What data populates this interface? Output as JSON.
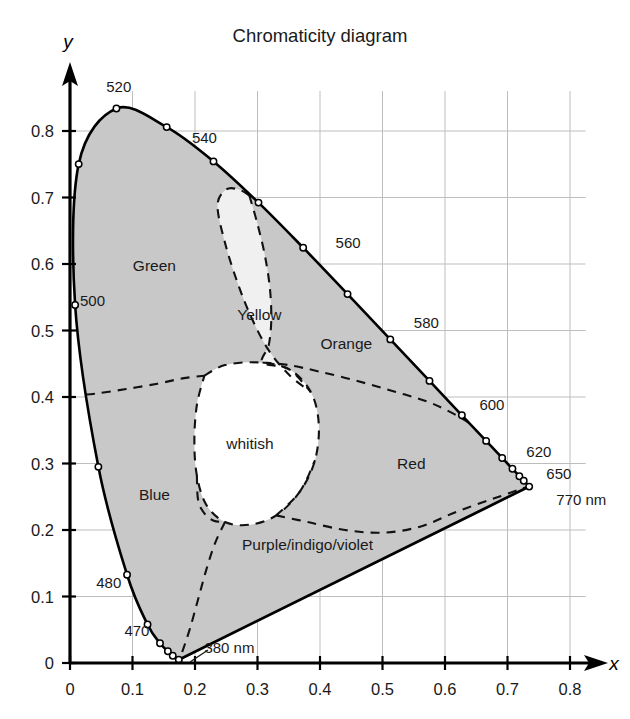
{
  "title": "Chromaticity diagram",
  "axes": {
    "x_name": "x",
    "y_name": "y",
    "x_ticks": [
      "0",
      "0.1",
      "0.2",
      "0.3",
      "0.4",
      "0.5",
      "0.6",
      "0.7",
      "0.8"
    ],
    "y_ticks": [
      "0",
      "0.1",
      "0.2",
      "0.3",
      "0.4",
      "0.5",
      "0.6",
      "0.7",
      "0.8"
    ]
  },
  "regions": [
    {
      "id": "green",
      "label": "Green",
      "x": 0.135,
      "y": 0.597
    },
    {
      "id": "yellow",
      "label": "Yellow",
      "x": 0.303,
      "y": 0.523
    },
    {
      "id": "orange",
      "label": "Orange",
      "x": 0.442,
      "y": 0.48
    },
    {
      "id": "red",
      "label": "Red",
      "x": 0.546,
      "y": 0.3
    },
    {
      "id": "blue",
      "label": "Blue",
      "x": 0.135,
      "y": 0.253
    },
    {
      "id": "purple",
      "label": "Purple/indigo/violet",
      "x": 0.38,
      "y": 0.178
    },
    {
      "id": "white",
      "label": "whitish",
      "x": 0.288,
      "y": 0.33
    }
  ],
  "colors": {
    "chromatic_fill": "#c8c8c8",
    "yellow_fill": "#f0f0f0",
    "white_fill": "#ffffff",
    "locus_stroke": "#000000",
    "grid": "#bdbdbd",
    "text": "#1a1a1a"
  },
  "chart_data": {
    "type": "scatter",
    "title": "Chromaticity diagram",
    "xlabel": "x",
    "ylabel": "y",
    "xlim": [
      0,
      0.8
    ],
    "ylim": [
      0,
      0.8
    ],
    "grid": true,
    "legend": "none",
    "annotations": [
      {
        "text": "380 nm",
        "x": 0.215,
        "y": 0.022
      },
      {
        "text": "470",
        "x": 0.107,
        "y": 0.048
      },
      {
        "text": "480",
        "x": 0.062,
        "y": 0.12
      },
      {
        "text": "500",
        "x": 0.016,
        "y": 0.545
      },
      {
        "text": "520",
        "x": 0.078,
        "y": 0.866
      },
      {
        "text": "540",
        "x": 0.215,
        "y": 0.79
      },
      {
        "text": "560",
        "x": 0.425,
        "y": 0.632
      },
      {
        "text": "580",
        "x": 0.55,
        "y": 0.512
      },
      {
        "text": "600",
        "x": 0.655,
        "y": 0.388
      },
      {
        "text": "620",
        "x": 0.73,
        "y": 0.318
      },
      {
        "text": "650",
        "x": 0.762,
        "y": 0.285
      },
      {
        "text": "770 nm",
        "x": 0.778,
        "y": 0.245
      }
    ],
    "spectral_locus": [
      {
        "nm": 380,
        "x": 0.1741,
        "y": 0.005
      },
      {
        "nm": 390,
        "x": 0.1738,
        "y": 0.0049
      },
      {
        "nm": 400,
        "x": 0.1733,
        "y": 0.0048
      },
      {
        "nm": 410,
        "x": 0.1726,
        "y": 0.0048
      },
      {
        "nm": 420,
        "x": 0.1714,
        "y": 0.0051
      },
      {
        "nm": 430,
        "x": 0.1689,
        "y": 0.0069
      },
      {
        "nm": 440,
        "x": 0.1644,
        "y": 0.0109
      },
      {
        "nm": 450,
        "x": 0.1566,
        "y": 0.0177
      },
      {
        "nm": 460,
        "x": 0.144,
        "y": 0.0297
      },
      {
        "nm": 470,
        "x": 0.1241,
        "y": 0.0578
      },
      {
        "nm": 480,
        "x": 0.0913,
        "y": 0.1327
      },
      {
        "nm": 490,
        "x": 0.0454,
        "y": 0.295
      },
      {
        "nm": 500,
        "x": 0.0082,
        "y": 0.5384
      },
      {
        "nm": 510,
        "x": 0.0139,
        "y": 0.7502
      },
      {
        "nm": 520,
        "x": 0.0743,
        "y": 0.8338
      },
      {
        "nm": 530,
        "x": 0.1547,
        "y": 0.8059
      },
      {
        "nm": 540,
        "x": 0.2296,
        "y": 0.7543
      },
      {
        "nm": 550,
        "x": 0.3016,
        "y": 0.6923
      },
      {
        "nm": 560,
        "x": 0.3731,
        "y": 0.6245
      },
      {
        "nm": 570,
        "x": 0.4441,
        "y": 0.5547
      },
      {
        "nm": 580,
        "x": 0.5125,
        "y": 0.4866
      },
      {
        "nm": 590,
        "x": 0.5752,
        "y": 0.4242
      },
      {
        "nm": 600,
        "x": 0.627,
        "y": 0.3725
      },
      {
        "nm": 610,
        "x": 0.6658,
        "y": 0.334
      },
      {
        "nm": 620,
        "x": 0.6915,
        "y": 0.3083
      },
      {
        "nm": 630,
        "x": 0.7079,
        "y": 0.292
      },
      {
        "nm": 640,
        "x": 0.719,
        "y": 0.2809
      },
      {
        "nm": 650,
        "x": 0.726,
        "y": 0.274
      },
      {
        "nm": 660,
        "x": 0.73,
        "y": 0.27
      },
      {
        "nm": 670,
        "x": 0.732,
        "y": 0.268
      },
      {
        "nm": 770,
        "x": 0.7347,
        "y": 0.2653
      }
    ],
    "markers": [
      {
        "nm": 380,
        "x": 0.1741,
        "y": 0.005
      },
      {
        "nm": 440,
        "x": 0.1644,
        "y": 0.0109
      },
      {
        "nm": 450,
        "x": 0.1566,
        "y": 0.0177
      },
      {
        "nm": 460,
        "x": 0.144,
        "y": 0.0297
      },
      {
        "nm": 470,
        "x": 0.1241,
        "y": 0.0578
      },
      {
        "nm": 480,
        "x": 0.0913,
        "y": 0.1327
      },
      {
        "nm": 490,
        "x": 0.0454,
        "y": 0.295
      },
      {
        "nm": 500,
        "x": 0.0082,
        "y": 0.5384
      },
      {
        "nm": 510,
        "x": 0.0139,
        "y": 0.7502
      },
      {
        "nm": 520,
        "x": 0.0743,
        "y": 0.8338
      },
      {
        "nm": 530,
        "x": 0.1547,
        "y": 0.8059
      },
      {
        "nm": 540,
        "x": 0.2296,
        "y": 0.7543
      },
      {
        "nm": 550,
        "x": 0.3016,
        "y": 0.6923
      },
      {
        "nm": 560,
        "x": 0.3731,
        "y": 0.6245
      },
      {
        "nm": 570,
        "x": 0.4441,
        "y": 0.5547
      },
      {
        "nm": 580,
        "x": 0.5125,
        "y": 0.4866
      },
      {
        "nm": 590,
        "x": 0.5752,
        "y": 0.4242
      },
      {
        "nm": 600,
        "x": 0.627,
        "y": 0.3725
      },
      {
        "nm": 610,
        "x": 0.6658,
        "y": 0.334
      },
      {
        "nm": 620,
        "x": 0.6915,
        "y": 0.3083
      },
      {
        "nm": 630,
        "x": 0.7079,
        "y": 0.292
      },
      {
        "nm": 640,
        "x": 0.719,
        "y": 0.2809
      },
      {
        "nm": 650,
        "x": 0.726,
        "y": 0.274
      },
      {
        "nm": 770,
        "x": 0.7347,
        "y": 0.2653
      }
    ]
  }
}
